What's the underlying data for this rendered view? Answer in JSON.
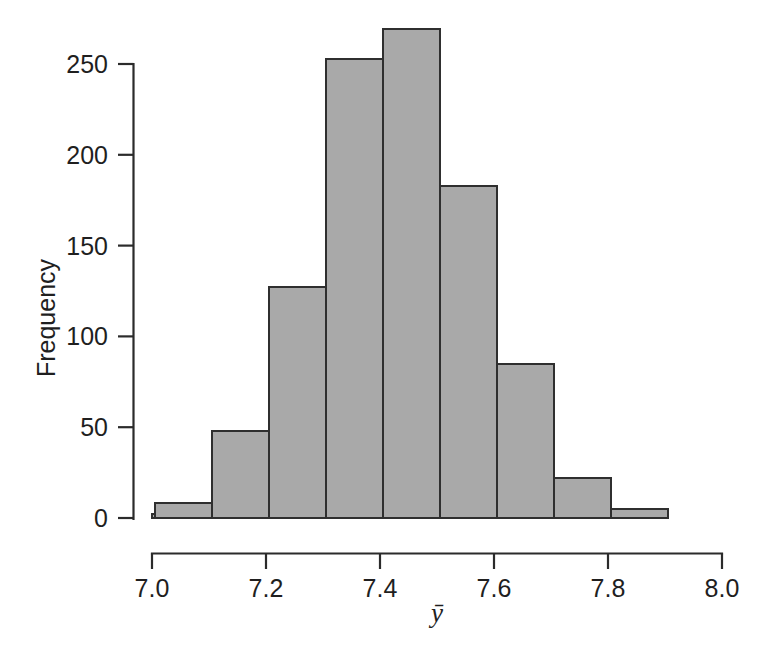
{
  "chart_data": {
    "type": "bar",
    "title": "",
    "subtitle": "",
    "xlabel": "ȳ",
    "ylabel": "Frequency",
    "xlim": [
      7.0,
      8.0
    ],
    "ylim": [
      0,
      270
    ],
    "grid": false,
    "legend": null,
    "bin_width": 0.1,
    "bin_edges": [
      7.0,
      7.1,
      7.2,
      7.3,
      7.4,
      7.5,
      7.6,
      7.7,
      7.8,
      7.9
    ],
    "categories": [
      "7.0-7.1",
      "7.1-7.2",
      "7.2-7.3",
      "7.3-7.4",
      "7.4-7.5",
      "7.5-7.6",
      "7.6-7.7",
      "7.7-7.8",
      "7.8-7.9"
    ],
    "values": [
      8,
      48,
      127,
      253,
      269,
      183,
      85,
      22,
      5
    ],
    "baseline_value": 2,
    "x_ticks": [
      7.0,
      7.2,
      7.4,
      7.6,
      7.8,
      8.0
    ],
    "x_tick_labels": [
      "7.0",
      "7.2",
      "7.4",
      "7.6",
      "7.8",
      "8.0"
    ],
    "y_ticks": [
      0,
      50,
      100,
      150,
      200,
      250
    ],
    "y_tick_labels": [
      "0",
      "50",
      "100",
      "150",
      "200",
      "250"
    ],
    "colors": {
      "bar_fill": "#a9a9a9",
      "bar_edge": "#2f2f2f",
      "axis": "#2b2b2b",
      "text": "#1f1f1f",
      "background": "#ffffff"
    }
  },
  "axes": {
    "y_axis_name": "frequency-axis",
    "x_axis_name": "ybar-axis"
  }
}
